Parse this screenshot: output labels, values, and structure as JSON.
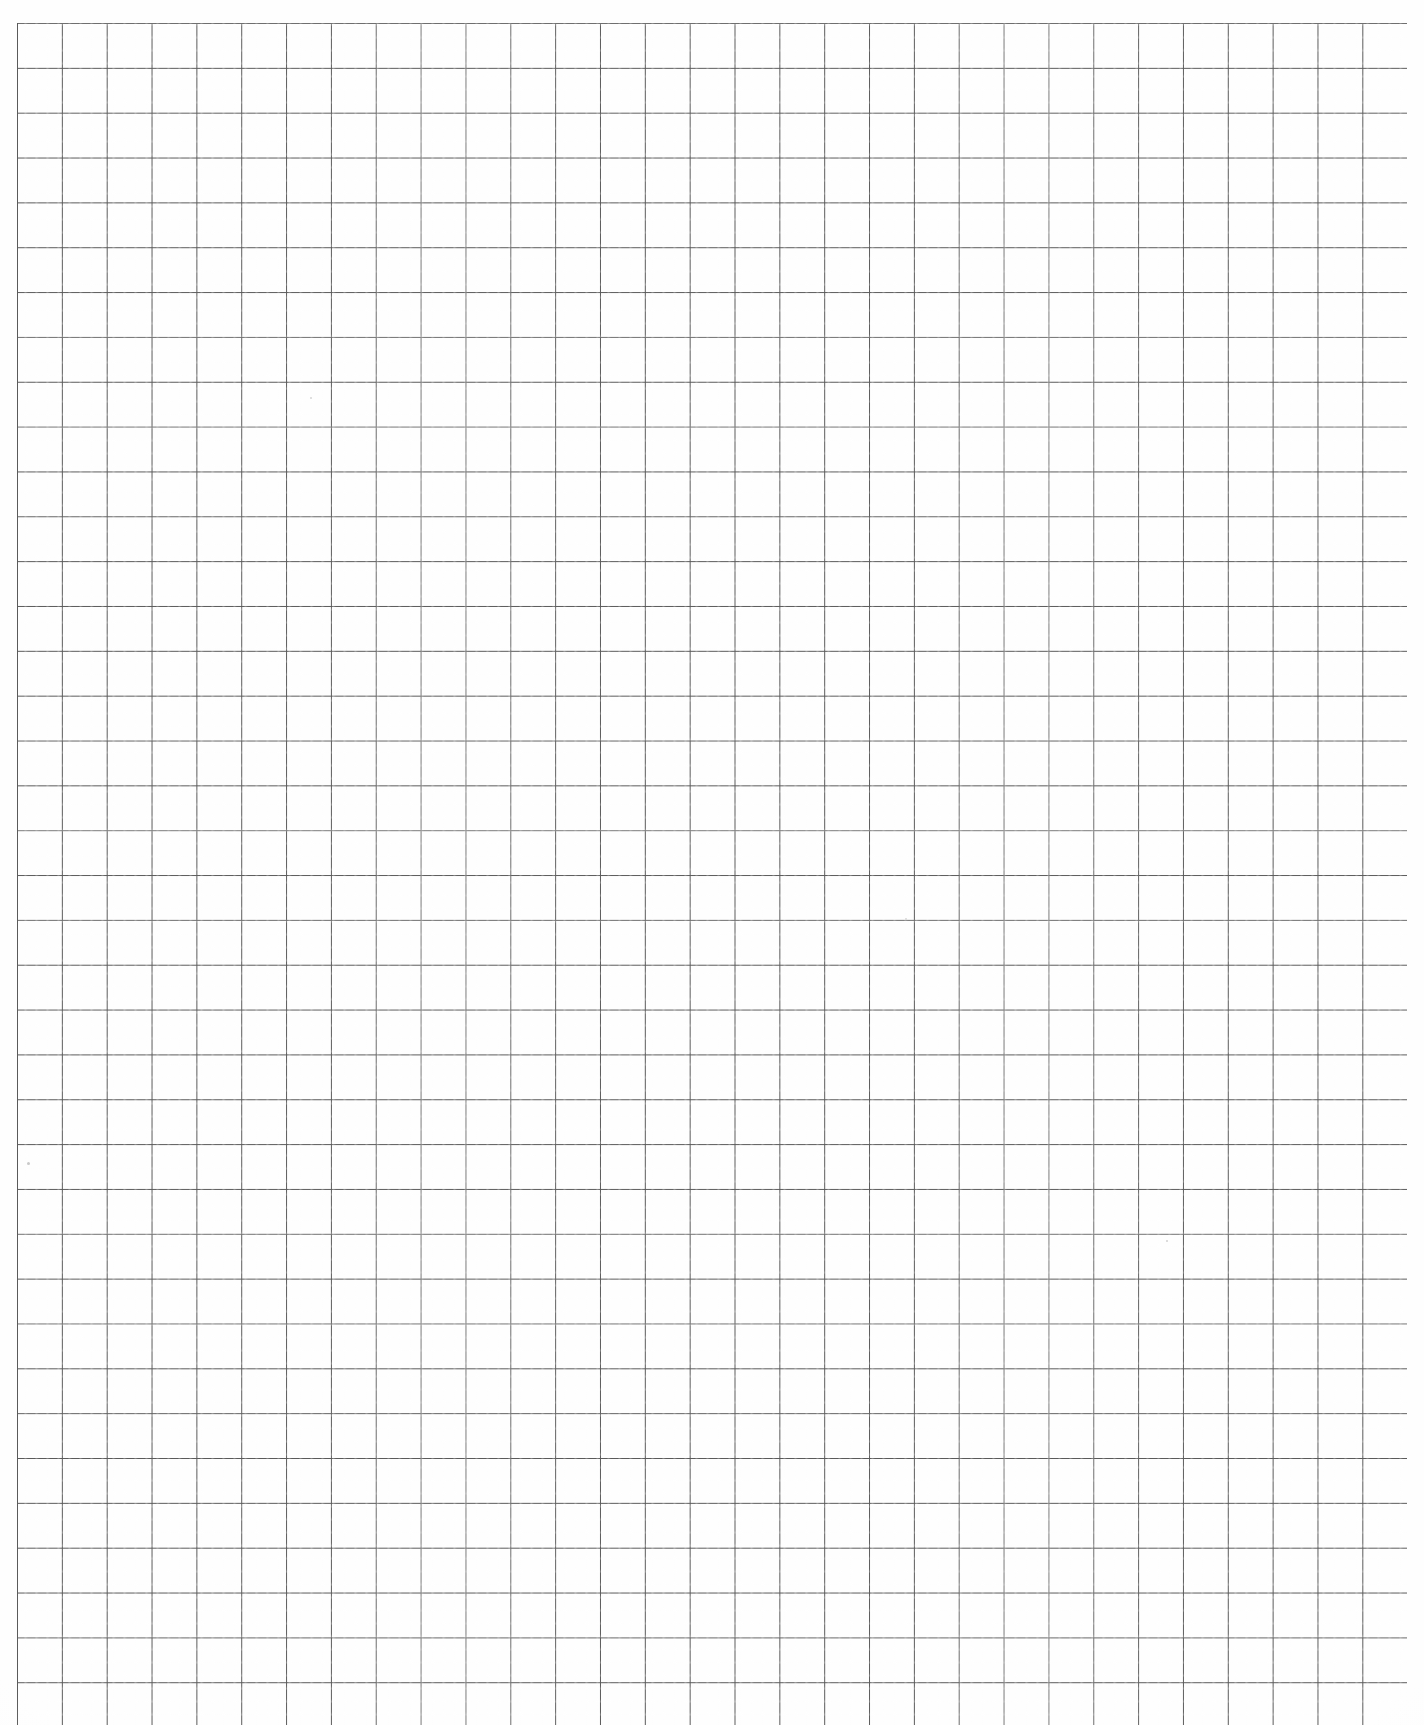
{
  "document": {
    "type": "graph-paper-scan",
    "title": "Blank Quadrille Graph Paper Sheet",
    "page_width": 1424,
    "page_height": 1725,
    "background_color": "#ffffff",
    "paper_color": "#fefefe",
    "has_text": false,
    "has_annotations": false,
    "orientation": "portrait"
  },
  "grid": {
    "origin_x": 17,
    "origin_y": 23,
    "cell_size": 44.85,
    "columns": 31,
    "rows": 38,
    "width": 1390,
    "height": 1705,
    "line_color": "#5a5a5a",
    "line_width": 1,
    "style": "uniform square grid",
    "major_lines": false,
    "margin_left": 17,
    "margin_top": 23,
    "margin_right": 18,
    "bleeds_off_bottom": true
  },
  "specks": [
    {
      "x": 27,
      "y": 1162,
      "size": 3,
      "color": "#c9c9c9"
    },
    {
      "x": 1166,
      "y": 1240,
      "size": 2,
      "color": "#d0d0d0"
    },
    {
      "x": 310,
      "y": 397,
      "size": 2,
      "color": "#d4d4d4"
    },
    {
      "x": 905,
      "y": 918,
      "size": 2,
      "color": "#d6d6d6"
    }
  ]
}
